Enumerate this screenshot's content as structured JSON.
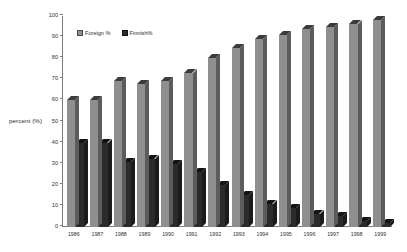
{
  "chart_data": {
    "type": "bar",
    "title": "",
    "subtitle": "",
    "xlabel": "",
    "ylabel": "percent (%)",
    "ylim": [
      0,
      100
    ],
    "ytick_step": 10,
    "grid": false,
    "legend_position": "top-left-inside",
    "style": "3d-grouped-column",
    "categories": [
      "1986",
      "1987",
      "1988",
      "1989",
      "1990",
      "1991",
      "1992",
      "1993",
      "1994",
      "1995",
      "1996",
      "1997",
      "1998",
      "1999"
    ],
    "yticks": [
      "0",
      "10",
      "20",
      "30",
      "40",
      "50",
      "60",
      "70",
      "80",
      "90",
      "100"
    ],
    "series": [
      {
        "name": "Foreign %",
        "color": "#8f8f8f",
        "values": [
          60,
          60,
          69,
          68,
          69,
          73,
          80,
          85,
          89,
          91,
          94,
          95,
          96,
          98
        ]
      },
      {
        "name": "Finnish%",
        "color": "#2b2b2b",
        "values": [
          40,
          40,
          31,
          32,
          30,
          26,
          20,
          15,
          11,
          9,
          6,
          5,
          3,
          2
        ]
      }
    ]
  },
  "legend": {
    "items": [
      {
        "label": "Foreign %",
        "swatch": "foreign"
      },
      {
        "label": "Finnish%",
        "swatch": "finnish"
      }
    ]
  },
  "axes": {
    "y_title": "percent (%)"
  }
}
